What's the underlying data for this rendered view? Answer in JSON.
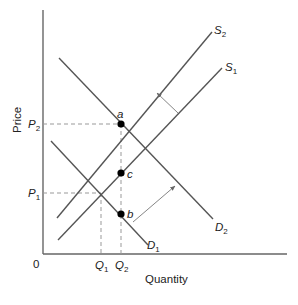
{
  "diagram": {
    "axes": {
      "y_label": "Price",
      "x_label": "Quantity",
      "origin_label": "0"
    },
    "price_ticks": [
      {
        "base": "P",
        "sub": "2"
      },
      {
        "base": "P",
        "sub": "1"
      }
    ],
    "quantity_ticks": [
      {
        "base": "Q",
        "sub": "1"
      },
      {
        "base": "Q",
        "sub": "2"
      }
    ],
    "curves": [
      {
        "name": "S1",
        "base": "S",
        "sub": "1",
        "type": "supply"
      },
      {
        "name": "S2",
        "base": "S",
        "sub": "2",
        "type": "supply"
      },
      {
        "name": "D1",
        "base": "D",
        "sub": "1",
        "type": "demand"
      },
      {
        "name": "D2",
        "base": "D",
        "sub": "2",
        "type": "demand"
      }
    ],
    "points": [
      {
        "label": "a",
        "at": "P2,Q2"
      },
      {
        "label": "b",
        "at": "D1,Q2"
      },
      {
        "label": "c",
        "at": "S1,Q2"
      }
    ],
    "shifts": [
      {
        "from": "S1",
        "to": "S2",
        "direction": "up-left"
      },
      {
        "from": "D1",
        "to": "D2",
        "direction": "up-right"
      }
    ],
    "colors": {
      "line": "#555555",
      "guide": "#999999",
      "point": "#000000"
    }
  }
}
